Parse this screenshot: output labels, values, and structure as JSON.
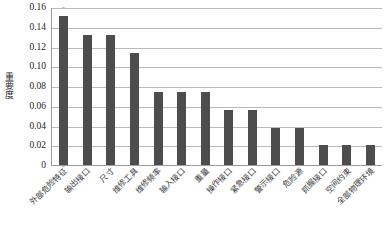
{
  "chart_data": {
    "type": "bar",
    "title": "",
    "xlabel": "",
    "ylabel": "重要度",
    "ylim": [
      0,
      0.16
    ],
    "grid": true,
    "legend": "none",
    "bar_color": "#4d4d4d",
    "categories": [
      "外部危险特征",
      "输出接口",
      "尺寸",
      "维修工具",
      "维修频率",
      "输入接口",
      "重量",
      "操作接口",
      "紧急接口",
      "警示接口",
      "危险源",
      "抓握接口",
      "空间约束",
      "全部物理环境"
    ],
    "values": [
      0.151,
      0.132,
      0.132,
      0.113,
      0.074,
      0.074,
      0.074,
      0.056,
      0.056,
      0.037,
      0.037,
      0.02,
      0.02,
      0.02
    ],
    "ytick_labels": [
      "0.16",
      "0.14",
      "0.12",
      "0.10",
      "0.08",
      "0.06",
      "0.04",
      "0.02",
      "0"
    ],
    "ytick_values": [
      0.16,
      0.14,
      0.12,
      0.1,
      0.08,
      0.06,
      0.04,
      0.02,
      0
    ]
  }
}
